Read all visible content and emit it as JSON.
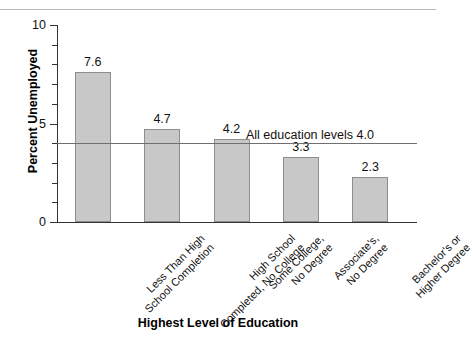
{
  "chart_data": {
    "type": "bar",
    "title": "",
    "xlabel": "Highest Level of Education",
    "ylabel": "Percent Unemployed",
    "ylim": [
      0,
      10
    ],
    "ytick_labels": [
      "10",
      "5",
      "0"
    ],
    "ytick_values": [
      10,
      5,
      0
    ],
    "minor_ticks": [
      9,
      8,
      7,
      6,
      4,
      3,
      2,
      1
    ],
    "grid": false,
    "legend": "none",
    "categories": [
      "Less Than High School Completion",
      "High School Completed, No College",
      "Some College, No Degree",
      "Associate's, No Degree",
      "Bachelor's or Higher Degree"
    ],
    "category_lines": [
      [
        "Less Than High",
        "School Completion"
      ],
      [
        "High School",
        "Completed, No College"
      ],
      [
        "Some College,",
        "No Degree"
      ],
      [
        "Associate's,",
        "No Degree"
      ],
      [
        "Bachelor's or",
        "Higher Degree"
      ]
    ],
    "values": [
      7.6,
      4.7,
      4.2,
      3.3,
      2.3
    ],
    "value_labels": [
      "7.6",
      "4.7",
      "4.2",
      "3.3",
      "2.3"
    ],
    "reference_line": {
      "value": 4.0,
      "label": "All education levels 4.0"
    },
    "bar_color": "#c8c8c8",
    "bar_border_color": "#8e8e8e",
    "axis_color": "#333333",
    "reference_line_color": "#6f6f6f"
  }
}
